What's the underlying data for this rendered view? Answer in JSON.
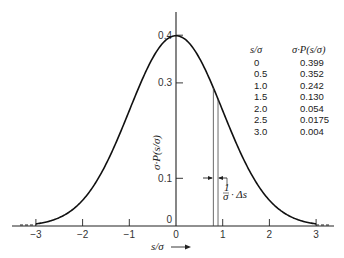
{
  "chart_data": {
    "type": "line",
    "title": "",
    "xlabel": "s/σ →",
    "ylabel": "σ·P(s/σ)",
    "xlim": [
      -3.3,
      3.3
    ],
    "ylim": [
      0,
      0.45
    ],
    "x_ticks": [
      "−3",
      "−2",
      "−1",
      "0",
      "1",
      "2",
      "3"
    ],
    "y_ticks": [
      "0",
      "0.1",
      "0.3",
      "0.4"
    ],
    "grid": false,
    "series": [
      {
        "name": "Normal distribution σ·P(s/σ)",
        "x": [
          -3.0,
          -2.5,
          -2.0,
          -1.5,
          -1.0,
          -0.5,
          0,
          0.5,
          1.0,
          1.5,
          2.0,
          2.5,
          3.0
        ],
        "y": [
          0.004,
          0.0175,
          0.054,
          0.13,
          0.242,
          0.352,
          0.399,
          0.352,
          0.242,
          0.13,
          0.054,
          0.0175,
          0.004
        ]
      }
    ],
    "annotations": [
      {
        "text": "(1/σ)·Δs",
        "note": "width of shaded strip near s/σ ≈ 0.8–0.9, indicated by arrows at y ≈ 0.1"
      }
    ],
    "table": {
      "headers": [
        "s/σ",
        "σ·P(s/σ)"
      ],
      "rows": [
        [
          "0",
          "0.399"
        ],
        [
          "0.5",
          "0.352"
        ],
        [
          "1.0",
          "0.242"
        ],
        [
          "1.5",
          "0.130"
        ],
        [
          "2.0",
          "0.054"
        ],
        [
          "2.5",
          "0.0175"
        ],
        [
          "3.0",
          "0.004"
        ]
      ]
    }
  },
  "labels": {
    "y_axis": "σ·P(s/σ)",
    "x_axis": "s/σ",
    "delta_frac_num": "1",
    "delta_frac_den": "σ",
    "delta_rest": "· Δs"
  }
}
